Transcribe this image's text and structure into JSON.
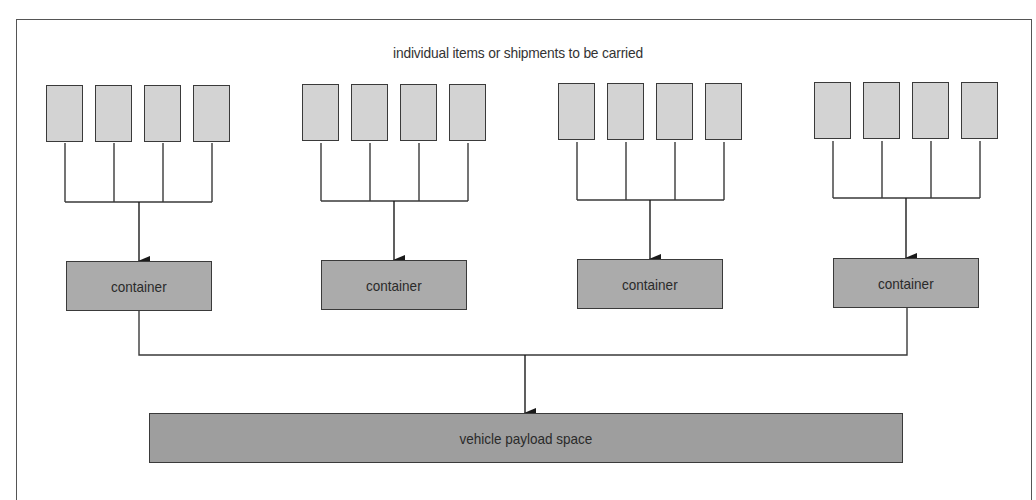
{
  "diagram": {
    "title": "individual items or shipments to be carried",
    "groups": [
      {
        "container_label": "container",
        "item_count": 4
      },
      {
        "container_label": "container",
        "item_count": 4
      },
      {
        "container_label": "container",
        "item_count": 4
      },
      {
        "container_label": "container",
        "item_count": 4
      }
    ],
    "payload_label": "vehicle payload space",
    "colors": {
      "item_fill": "#d3d3d3",
      "container_fill": "#ababab",
      "payload_fill": "#9e9e9e",
      "stroke": "#3a3a3a"
    }
  }
}
